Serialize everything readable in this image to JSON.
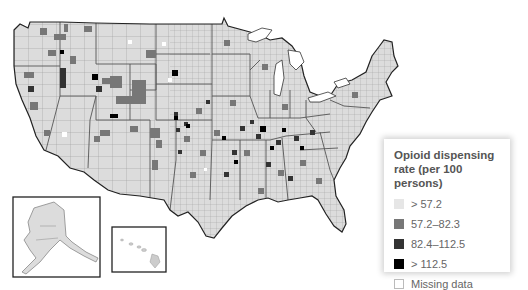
{
  "legend": {
    "title_line1": "Opioid dispensing",
    "title_line2": "rate (per 100 persons)",
    "items": [
      {
        "label": "> 57.2",
        "color": "#e6e6e6"
      },
      {
        "label": "57.2–82.3",
        "color": "#777777"
      },
      {
        "label": "82.4–112.5",
        "color": "#333333"
      },
      {
        "label": "> 112.5",
        "color": "#000000"
      },
      {
        "label": "Missing data",
        "color": "#ffffff"
      }
    ]
  },
  "map": {
    "subject": "United States counties",
    "insets": [
      "Alaska",
      "Hawaii"
    ],
    "base_fill": "#d9d9d9",
    "border_color": "#888888",
    "outline_color": "#222222"
  }
}
